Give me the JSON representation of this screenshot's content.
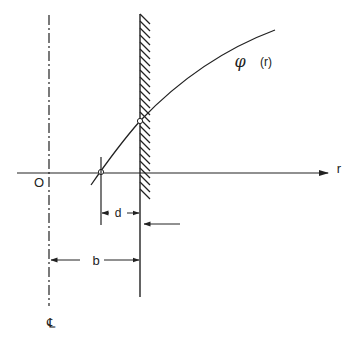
{
  "diagram": {
    "labels": {
      "origin": "O",
      "r_axis": "r",
      "function": "φ",
      "function_arg": "(r)",
      "dim_d": "d",
      "dim_b": "b",
      "centerline": "℄"
    },
    "colors": {
      "ink": "#222222",
      "background": "#ffffff"
    }
  }
}
